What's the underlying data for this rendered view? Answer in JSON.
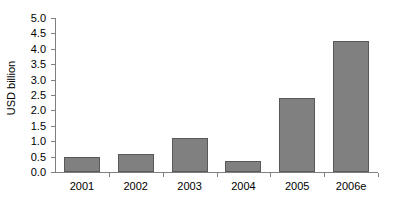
{
  "chart_data": {
    "type": "bar",
    "title": "",
    "subtitle": "",
    "xlabel": "",
    "ylabel": "USD billion",
    "categories": [
      "2001",
      "2002",
      "2003",
      "2004",
      "2005",
      "2006e"
    ],
    "values": [
      0.5,
      0.6,
      1.1,
      0.35,
      2.4,
      4.25
    ],
    "series": [
      {
        "name": "USD billion",
        "values": [
          0.5,
          0.6,
          1.1,
          0.35,
          2.4,
          4.25
        ]
      }
    ],
    "ylim": [
      0.0,
      5.0
    ],
    "ytick_step": 0.5,
    "ytick_labels": [
      "0.0",
      "0.5",
      "1.0",
      "1.5",
      "2.0",
      "2.5",
      "3.0",
      "3.5",
      "4.0",
      "4.5",
      "5.0"
    ],
    "ytick_values": [
      0.0,
      0.5,
      1.0,
      1.5,
      2.0,
      2.5,
      3.0,
      3.5,
      4.0,
      4.5,
      5.0
    ],
    "grid": false,
    "legend": false,
    "legend_position": "none",
    "annotations": [],
    "colors": {
      "bar_fill": "#808080",
      "bar_border": "#585858",
      "axis": "#808080",
      "text": "#000000",
      "background": "#ffffff"
    }
  }
}
